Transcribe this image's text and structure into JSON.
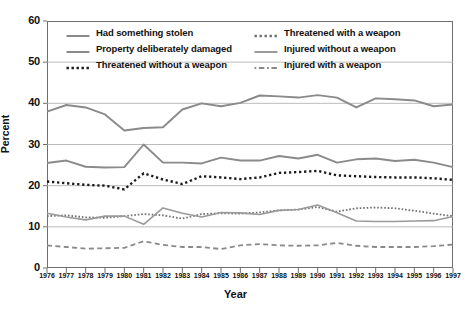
{
  "chart_data": {
    "type": "line",
    "title": "",
    "xlabel": "Year",
    "ylabel": "Percent",
    "xlim": [
      1976,
      1997
    ],
    "ylim": [
      0,
      60
    ],
    "ytick_step": 10,
    "grid": true,
    "grid_axis": "y",
    "legend_position": "top-inside-two-columns",
    "categories": [
      1976,
      1977,
      1978,
      1979,
      1980,
      1981,
      1982,
      1983,
      1984,
      1985,
      1986,
      1987,
      1988,
      1989,
      1990,
      1991,
      1992,
      1993,
      1994,
      1995,
      1996,
      1997
    ],
    "x_tick_labels": [
      "1976",
      "1977",
      "1978",
      "1979",
      "1980",
      "1981",
      "1982",
      "1983",
      "1984",
      "1985",
      "1986",
      "1987",
      "1988",
      "1989",
      "1990",
      "1991",
      "1992",
      "1993",
      "1994",
      "1995",
      "1996",
      "1997"
    ],
    "y_tick_labels": [
      "0",
      "10",
      "20",
      "30",
      "40",
      "50",
      "60"
    ],
    "series": [
      {
        "name": "Had something stolen",
        "style": "solid",
        "width": 1.9,
        "color": "#8a8a8a",
        "values": [
          38.0,
          39.6,
          39.0,
          37.3,
          33.4,
          34.0,
          34.2,
          38.5,
          40.0,
          39.3,
          40.1,
          41.9,
          41.7,
          41.4,
          42.0,
          41.4,
          39.0,
          41.2,
          41.0,
          40.7,
          39.3,
          39.7
        ]
      },
      {
        "name": "Property deliberately damaged",
        "style": "solid",
        "width": 1.9,
        "color": "#8a8a8a",
        "values": [
          25.5,
          26.1,
          24.6,
          24.4,
          24.5,
          30.0,
          25.6,
          25.6,
          25.4,
          26.8,
          26.1,
          26.1,
          27.2,
          26.6,
          27.5,
          25.6,
          26.4,
          26.6,
          26.0,
          26.3,
          25.6,
          24.5
        ]
      },
      {
        "name": "Threatened without a weapon",
        "style": "dotted",
        "width": 2.4,
        "color": "#1a1a1a",
        "values": [
          21.0,
          20.6,
          20.2,
          20.0,
          19.1,
          23.0,
          21.5,
          20.4,
          22.3,
          22.0,
          21.6,
          22.0,
          23.1,
          23.3,
          23.6,
          22.5,
          22.3,
          22.1,
          22.0,
          22.0,
          21.8,
          21.4
        ]
      },
      {
        "name": "Threatened with a weapon",
        "style": "dotted",
        "width": 1.8,
        "color": "#6f6f6f",
        "values": [
          12.6,
          12.8,
          12.3,
          12.2,
          12.6,
          13.1,
          12.8,
          12.0,
          13.1,
          13.3,
          13.2,
          13.5,
          14.0,
          14.2,
          14.8,
          13.7,
          14.5,
          14.7,
          14.5,
          13.9,
          13.2,
          12.6
        ]
      },
      {
        "name": "Injured without a weapon",
        "style": "solid",
        "width": 1.6,
        "color": "#9a9a9a",
        "values": [
          13.3,
          12.4,
          11.7,
          12.6,
          12.6,
          10.6,
          14.6,
          13.3,
          12.4,
          13.5,
          13.4,
          13.0,
          14.0,
          14.2,
          15.3,
          13.4,
          11.4,
          11.3,
          11.3,
          11.4,
          11.5,
          12.5
        ]
      },
      {
        "name": "Injured with a weapon",
        "style": "dashed",
        "width": 1.8,
        "color": "#8a8a8a",
        "values": [
          5.5,
          5.1,
          4.7,
          4.8,
          4.9,
          6.5,
          5.6,
          5.1,
          5.1,
          4.6,
          5.5,
          5.8,
          5.5,
          5.4,
          5.5,
          6.1,
          5.4,
          5.1,
          5.1,
          5.1,
          5.3,
          5.7
        ]
      }
    ]
  },
  "axes": {
    "ylabel": "Percent",
    "xlabel": "Year"
  },
  "legend": {
    "items": [
      {
        "label": "Had something stolen",
        "style": "solid",
        "color": "#8a8a8a"
      },
      {
        "label": "Threatened with a weapon",
        "style": "dotted",
        "color": "#6f6f6f"
      },
      {
        "label": "Property deliberately damaged",
        "style": "solid",
        "color": "#8a8a8a"
      },
      {
        "label": "Injured without a weapon",
        "style": "solid",
        "color": "#9a9a9a"
      },
      {
        "label": "Threatened without a weapon",
        "style": "dotted",
        "color": "#1a1a1a"
      },
      {
        "label": "Injured with a weapon",
        "style": "dashed",
        "color": "#8a8a8a"
      }
    ],
    "order": [
      0,
      1,
      2,
      3,
      4,
      5
    ]
  },
  "colors": {
    "frame": "#6f6f6f",
    "gridline": "#a9a9a9",
    "text": "#111111",
    "background": "#ffffff"
  },
  "top_caption": ""
}
